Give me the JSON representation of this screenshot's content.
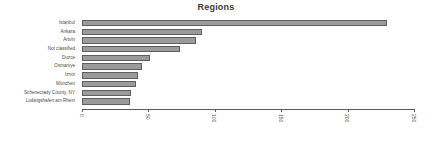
{
  "chart_data": {
    "type": "bar",
    "orientation": "horizontal",
    "title": "Regions",
    "xlabel": "",
    "ylabel": "",
    "xlim": [
      0,
      250
    ],
    "grid": false,
    "legend": null,
    "xticks": [
      "0",
      "50",
      "100",
      "150",
      "200",
      "250"
    ],
    "xtick_values": [
      0,
      50,
      100,
      150,
      200,
      250
    ],
    "categories": [
      "Istanbul",
      "Ankara",
      "Artvin",
      "Not classified",
      "Duzce",
      "Osmaniye",
      "Izmir",
      "München",
      "Schenectady County, NY",
      "Ludwigshafen am Rhein"
    ],
    "values": [
      230,
      90,
      86,
      74,
      51,
      45,
      42,
      41,
      37,
      36
    ],
    "bar_color": "#9b9b9b",
    "bar_border_color": "#5e5e5e",
    "axis_color": "#5a5a5a",
    "text_color": "#4a4a4a",
    "background": "#ffffff"
  }
}
